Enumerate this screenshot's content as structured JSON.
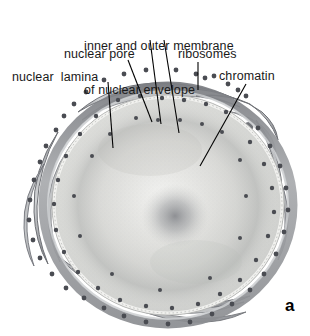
{
  "figure": {
    "panel_letter": "a",
    "background_color": "#ffffff"
  },
  "labels": [
    {
      "id": "membrane",
      "name": "label-inner-and-outer-membrane",
      "line1": "inner and outer membrane",
      "line2": "of nuclear envelope",
      "text": "inner and outer membrane of nuclear envelope"
    },
    {
      "id": "pore",
      "name": "label-nuclear-pore",
      "text": "nuclear pore"
    },
    {
      "id": "ribosomes",
      "name": "label-ribosomes",
      "text": "ribosomes"
    },
    {
      "id": "lamina",
      "name": "label-nuclear-lamina",
      "text": "nuclear  lamina"
    },
    {
      "id": "chromatin",
      "name": "label-chromatin",
      "text": "chromatin"
    }
  ],
  "leader_lines": [
    {
      "id": "lamina-leader",
      "from": [
        108,
        82
      ],
      "to": [
        113,
        148
      ],
      "label": "nuclear lamina"
    },
    {
      "id": "pore-leader",
      "from": [
        128,
        60
      ],
      "to": [
        152,
        122
      ],
      "label": "nuclear pore"
    },
    {
      "id": "membrane-leader-outer",
      "from": [
        150,
        40
      ],
      "to": [
        160,
        124
      ],
      "label": "outer membrane"
    },
    {
      "id": "membrane-leader-inner",
      "from": [
        164,
        40
      ],
      "to": [
        178,
        133
      ],
      "label": "inner membrane"
    },
    {
      "id": "ribosomes-leader",
      "from": [
        198,
        62
      ],
      "to": [
        198,
        90
      ],
      "label": "ribosomes"
    },
    {
      "id": "chromatin-leader",
      "from": [
        246,
        84
      ],
      "to": [
        200,
        166
      ],
      "label": "chromatin"
    }
  ],
  "colors": {
    "ink": "#1a1a1a",
    "leader_line": "#000000",
    "membrane_dark": "#6f7176",
    "membrane_mid": "#9a9ca0",
    "membrane_light": "#c7c9cc",
    "lumen": "#b4b6ba",
    "ribosome_dot": "#4a4c52",
    "nucleoplasm_light": "#e8e8e6",
    "nucleoplasm_mid": "#d2d3d1",
    "nucleolus": "#8e9095",
    "lamina_edge": "#f2f2f0"
  },
  "structures": {
    "nucleus": {
      "center": [
        168,
        205
      ],
      "radius_x": 118,
      "radius_y": 112,
      "description": "round nucleus with pale nucleoplasm"
    },
    "nucleolus": {
      "center": [
        175,
        216
      ],
      "radius": 30,
      "description": "diffuse dark nucleolus"
    },
    "nuclear_envelope": {
      "description": "double membrane with pores, studded with ribosomes"
    },
    "rough_er": {
      "count_sheets": 12,
      "description": "flattened ER cisternae radiating around nucleus, studded with ribosomes"
    }
  }
}
